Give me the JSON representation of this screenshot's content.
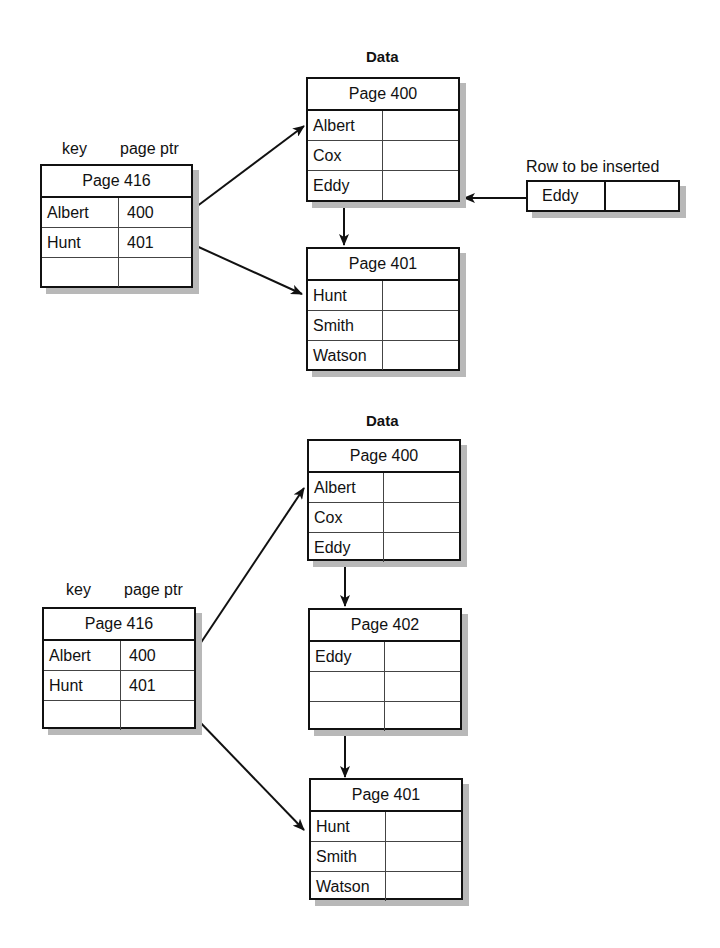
{
  "diagram": {
    "top": {
      "data_title": "Data",
      "index": {
        "col_labels": {
          "key": "key",
          "ptr": "page ptr"
        },
        "title": "Page 416",
        "rows": [
          [
            "Albert",
            "400"
          ],
          [
            "Hunt",
            "401"
          ],
          [
            "",
            ""
          ]
        ]
      },
      "pages": [
        {
          "title": "Page 400",
          "rows": [
            "Albert",
            "Cox",
            "Eddy"
          ]
        },
        {
          "title": "Page 401",
          "rows": [
            "Hunt",
            "Smith",
            "Watson"
          ]
        }
      ],
      "insert": {
        "label": "Row to be inserted",
        "value": "Eddy"
      }
    },
    "bottom": {
      "data_title": "Data",
      "index": {
        "col_labels": {
          "key": "key",
          "ptr": "page ptr"
        },
        "title": "Page 416",
        "rows": [
          [
            "Albert",
            "400"
          ],
          [
            "Hunt",
            "401"
          ],
          [
            "",
            ""
          ]
        ]
      },
      "pages": [
        {
          "title": "Page 400",
          "rows": [
            "Albert",
            "Cox",
            "Eddy"
          ]
        },
        {
          "title": "Page 402",
          "rows": [
            "Eddy",
            "",
            ""
          ]
        },
        {
          "title": "Page 401",
          "rows": [
            "Hunt",
            "Smith",
            "Watson"
          ]
        }
      ]
    }
  }
}
